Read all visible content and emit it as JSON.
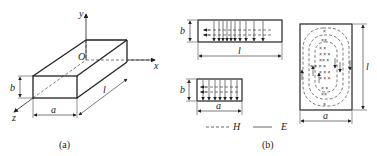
{
  "figure_a": {
    "caption": "(a)",
    "axes": {
      "x": "x",
      "y": "y",
      "z": "z",
      "origin": "O"
    },
    "dimensions": {
      "width": "a",
      "height": "b",
      "length": "l"
    }
  },
  "figure_b": {
    "caption": "(b)",
    "side_view": {
      "height_label": "b",
      "length_label": "l"
    },
    "end_view": {
      "height_label": "b",
      "width_label": "a"
    },
    "top_view": {
      "width_label": "a",
      "length_label": "l"
    },
    "legend": [
      {
        "style": "dashed",
        "label": "H"
      },
      {
        "style": "solid",
        "label": "E"
      }
    ]
  }
}
